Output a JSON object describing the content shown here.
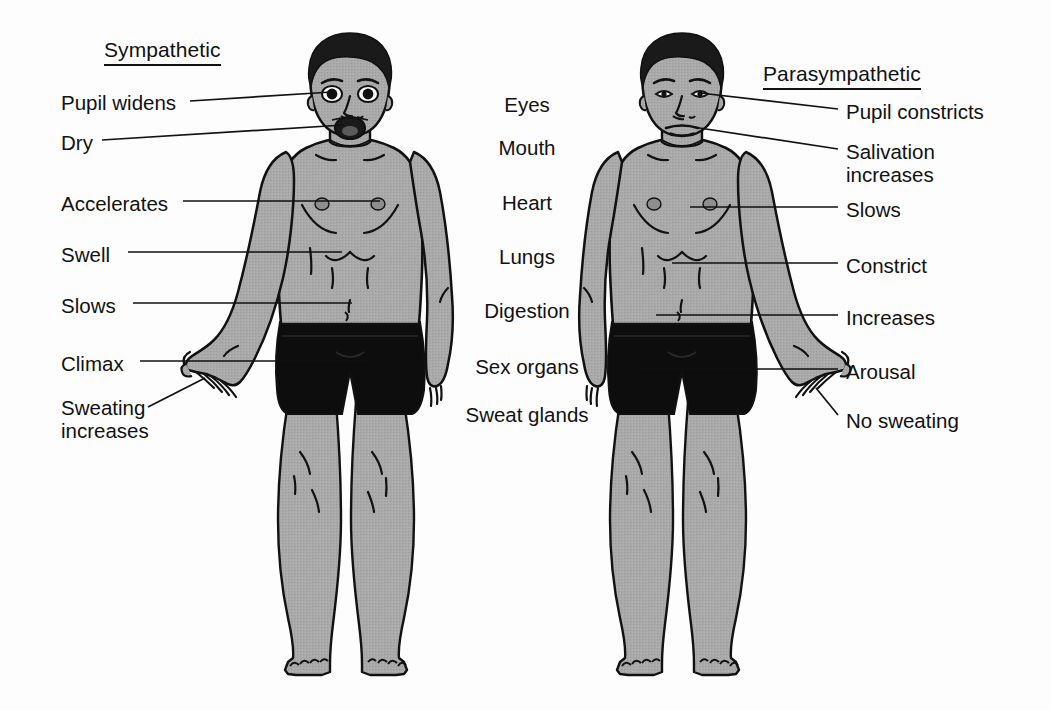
{
  "diagram": {
    "title_left": "Sympathetic",
    "title_right": "Parasympathetic",
    "background_color": "#fdfdfd",
    "skin_color": "#a9a9a9",
    "hair_color": "#1a1a1a",
    "shorts_color": "#0d0d0d",
    "outline_color": "#111111",
    "leader_line_color": "#111111"
  },
  "organs": [
    {
      "name": "Eyes",
      "x": 527,
      "y": 105
    },
    {
      "name": "Mouth",
      "x": 527,
      "y": 148
    },
    {
      "name": "Heart",
      "x": 527,
      "y": 203
    },
    {
      "name": "Lungs",
      "x": 527,
      "y": 257
    },
    {
      "name": "Digestion",
      "x": 527,
      "y": 311
    },
    {
      "name": "Sex organs",
      "x": 527,
      "y": 367
    },
    {
      "name": "Sweat glands",
      "x": 527,
      "y": 415
    }
  ],
  "sympathetic_labels": [
    {
      "text": "Pupil widens",
      "x": 61,
      "y": 91,
      "lines": 1
    },
    {
      "text": "Dry",
      "x": 61,
      "y": 131,
      "lines": 1
    },
    {
      "text": "Accelerates",
      "x": 61,
      "y": 192,
      "lines": 1
    },
    {
      "text": "Swell",
      "x": 61,
      "y": 243,
      "lines": 1
    },
    {
      "text": "Slows",
      "x": 61,
      "y": 294,
      "lines": 1
    },
    {
      "text": "Climax",
      "x": 61,
      "y": 352,
      "lines": 1
    },
    {
      "text": "Sweating\nincreases",
      "x": 61,
      "y": 396,
      "lines": 2
    }
  ],
  "parasympathetic_labels": [
    {
      "text": "Pupil constricts",
      "x": 846,
      "y": 100,
      "lines": 1
    },
    {
      "text": "Salivation\nincreases",
      "x": 846,
      "y": 140,
      "lines": 2
    },
    {
      "text": "Slows",
      "x": 846,
      "y": 198,
      "lines": 1
    },
    {
      "text": "Constrict",
      "x": 846,
      "y": 254,
      "lines": 1
    },
    {
      "text": "Increases",
      "x": 846,
      "y": 306,
      "lines": 1
    },
    {
      "text": "Arousal",
      "x": 846,
      "y": 360,
      "lines": 1
    },
    {
      "text": "No sweating",
      "x": 846,
      "y": 409,
      "lines": 1
    }
  ],
  "figures": {
    "left": {
      "state": "sympathetic",
      "mouth": "open",
      "pupils": "dilated"
    },
    "right": {
      "state": "parasympathetic",
      "mouth": "closed",
      "pupils": "constricted"
    }
  }
}
